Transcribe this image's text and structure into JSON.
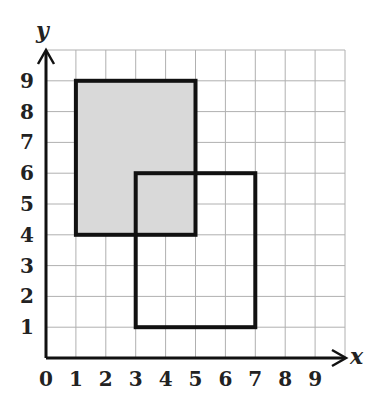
{
  "diagram": {
    "type": "coordinate-grid",
    "x_axis": {
      "label": "x",
      "ticks": [
        "0",
        "1",
        "2",
        "3",
        "4",
        "5",
        "6",
        "7",
        "8",
        "9"
      ],
      "range": [
        0,
        10
      ]
    },
    "y_axis": {
      "label": "y",
      "ticks": [
        "1",
        "2",
        "3",
        "4",
        "5",
        "6",
        "7",
        "8",
        "9"
      ],
      "range": [
        0,
        10
      ]
    },
    "rectangles": [
      {
        "name": "shaded-rectangle",
        "x1": 1,
        "y1": 4,
        "x2": 5,
        "y2": 9,
        "fill": "#d9d9d9",
        "stroke": "#111111"
      },
      {
        "name": "outline-rectangle",
        "x1": 3,
        "y1": 1,
        "x2": 7,
        "y2": 6,
        "fill": "none",
        "stroke": "#111111"
      }
    ],
    "colors": {
      "grid": "#b0b0b0",
      "axis": "#111111",
      "shade": "#d9d9d9"
    }
  }
}
